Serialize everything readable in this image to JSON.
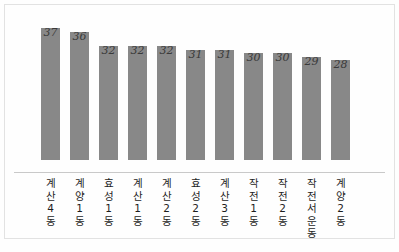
{
  "chart_data": {
    "type": "bar",
    "title": "",
    "subtitle": "",
    "xlabel": "",
    "ylabel": "",
    "grid": false,
    "legend": "none",
    "axis_visible": true,
    "ylim": [
      0,
      41
    ],
    "categories": [
      "계산4동",
      "계양1동",
      "효성1동",
      "계산1동",
      "계산2동",
      "효성2동",
      "계산3동",
      "작전1동",
      "작전2동",
      "작전서운동",
      "계양2동"
    ],
    "values": [
      37,
      36,
      32,
      32,
      32,
      31,
      31,
      30,
      30,
      29,
      28
    ],
    "value_labels": [
      "37",
      "36",
      "32",
      "32",
      "32",
      "31",
      "31",
      "30",
      "30",
      "29",
      "28"
    ],
    "bar_color": "#888888",
    "axis_color": "#c9c9c9",
    "frame_color": "#e2e2e2",
    "background_color": "#fefefe",
    "label_color": "#1d1d1d",
    "value_color": "#3a3a3a",
    "label_orientation": "vertical"
  }
}
